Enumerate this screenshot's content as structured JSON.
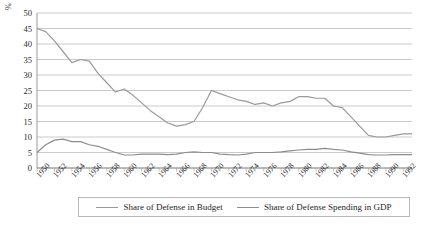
{
  "chart_data": {
    "type": "line",
    "title": "",
    "subtitle": "",
    "xlabel": "",
    "ylabel": "%",
    "ylim": [
      0,
      50
    ],
    "ytick_step": 5,
    "yticks": [
      "50",
      "45",
      "40",
      "35",
      "30",
      "25",
      "20",
      "15",
      "10",
      "5",
      "0"
    ],
    "grid": true,
    "grid_axis": "y",
    "legend_position": "bottom",
    "x": [
      1950,
      1951,
      1952,
      1953,
      1954,
      1955,
      1956,
      1957,
      1958,
      1959,
      1960,
      1961,
      1962,
      1963,
      1964,
      1965,
      1966,
      1967,
      1968,
      1969,
      1970,
      1971,
      1972,
      1973,
      1974,
      1975,
      1976,
      1977,
      1978,
      1979,
      1980,
      1981,
      1982,
      1983,
      1984,
      1985,
      1986,
      1987,
      1988,
      1989,
      1990,
      1991,
      1992,
      1993
    ],
    "xtick_labels": [
      "1950",
      "1952",
      "1954",
      "1956",
      "1958",
      "1960",
      "1962",
      "1964",
      "1966",
      "1968",
      "1970",
      "1972",
      "1974",
      "1976",
      "1978",
      "1980",
      "1982",
      "1984",
      "1986",
      "1988",
      "1990",
      "1992"
    ],
    "xlim": [
      1950,
      1993
    ],
    "series": [
      {
        "name": "Share of Defense in Budget",
        "color": "#9a9a9a",
        "values": [
          45.0,
          44.0,
          41.0,
          37.5,
          34.0,
          35.0,
          34.5,
          30.5,
          27.5,
          24.5,
          25.5,
          23.5,
          21.0,
          18.5,
          16.5,
          14.5,
          13.5,
          14.0,
          15.0,
          19.5,
          25.0,
          24.0,
          23.0,
          22.0,
          21.5,
          20.5,
          21.0,
          20.0,
          21.0,
          21.5,
          23.0,
          23.0,
          22.5,
          22.5,
          20.0,
          19.5,
          16.5,
          13.5,
          10.5,
          10.0,
          10.0,
          10.5,
          11.0,
          11.0
        ]
      },
      {
        "name": "Share of Defense Spending in GDP",
        "color": "#8d8d8d",
        "values": [
          5.0,
          7.5,
          9.0,
          9.3,
          8.5,
          8.5,
          7.5,
          7.0,
          6.0,
          5.0,
          4.2,
          4.2,
          4.5,
          4.5,
          4.5,
          4.3,
          4.5,
          5.0,
          5.2,
          5.0,
          5.0,
          4.5,
          4.3,
          4.2,
          4.5,
          5.0,
          5.0,
          5.0,
          5.2,
          5.5,
          5.8,
          6.0,
          6.0,
          6.3,
          6.0,
          5.8,
          5.2,
          4.8,
          4.3,
          4.2,
          4.2,
          4.3,
          4.3,
          4.3
        ]
      }
    ],
    "annotations": []
  },
  "legend": {
    "entries": [
      {
        "label": "Share of Defense in Budget"
      },
      {
        "label": "Share of Defense Spending in GDP"
      }
    ]
  },
  "axes": {
    "unit_label": "%"
  }
}
